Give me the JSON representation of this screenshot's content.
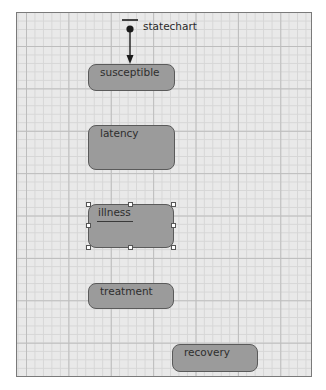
{
  "diagram": {
    "type": "statechart",
    "initial": {
      "label": "statechart",
      "target": "susceptible"
    },
    "states": [
      {
        "id": "susceptible",
        "label": "susceptible",
        "selected": false
      },
      {
        "id": "latency",
        "label": "latency",
        "selected": false
      },
      {
        "id": "illness",
        "label": "illness",
        "selected": true,
        "editing": true
      },
      {
        "id": "treatment",
        "label": "treatment",
        "selected": false
      },
      {
        "id": "recovery",
        "label": "recovery",
        "selected": false
      }
    ],
    "colors": {
      "state_fill": "#9b9b9b",
      "state_border": "#5a5a5a",
      "canvas_bg": "#e9e9e9",
      "grid_major": "#bdbdbd",
      "grid_minor": "#d6d6d6",
      "handle_fill": "#ffffff"
    }
  }
}
